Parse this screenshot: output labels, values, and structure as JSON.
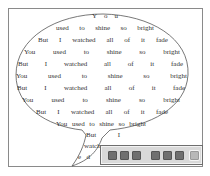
{
  "canvas": {
    "background": "#ffffff",
    "frame_color": "#8a8a8a"
  },
  "bubble": {
    "stroke_color": "#555555",
    "lines": [
      {
        "words": [
          "Y",
          "o",
          "u"
        ],
        "left": 92,
        "top": 12,
        "width": 26
      },
      {
        "words": [
          "used",
          "to",
          "shine",
          "so",
          "bright"
        ],
        "left": 56,
        "top": 24,
        "width": 98
      },
      {
        "words": [
          "But",
          "I",
          "watched",
          "all",
          "of",
          "it",
          "fade"
        ],
        "left": 38,
        "top": 36,
        "width": 130
      },
      {
        "words": [
          "You",
          "used",
          "to",
          "shine",
          "so",
          "bright"
        ],
        "left": 24,
        "top": 48,
        "width": 156
      },
      {
        "words": [
          "But",
          "I",
          "watched",
          "all",
          "of",
          "it",
          "fade"
        ],
        "left": 18,
        "top": 60,
        "width": 165
      },
      {
        "words": [
          "You",
          "used",
          "to",
          "shine",
          "so",
          "bright"
        ],
        "left": 16,
        "top": 72,
        "width": 171
      },
      {
        "words": [
          "But",
          "I",
          "watched",
          "all",
          "of",
          "it",
          "fade"
        ],
        "left": 17,
        "top": 84,
        "width": 168
      },
      {
        "words": [
          "You",
          "used",
          "to",
          "shine",
          "so",
          "bright"
        ],
        "left": 22,
        "top": 96,
        "width": 158
      },
      {
        "words": [
          "But",
          "I",
          "watched",
          "all",
          "of",
          "it",
          "fade"
        ],
        "left": 36,
        "top": 108,
        "width": 132
      },
      {
        "words": [
          "You",
          "used",
          "to",
          "shine",
          "so",
          "bright"
        ],
        "left": 56,
        "top": 120,
        "width": 90
      },
      {
        "words": [
          "But",
          "I"
        ],
        "left": 86,
        "top": 131,
        "width": 34
      },
      {
        "words": [
          "watch"
        ],
        "left": 84,
        "top": 142,
        "width": 22
      },
      {
        "words": [
          "e",
          "d"
        ],
        "left": 78,
        "top": 153,
        "width": 12
      }
    ]
  },
  "toolbar": {
    "background": "#d9d9d9",
    "buttons": [
      {
        "name": "tool-1",
        "icon": "square-icon",
        "x": 7,
        "style": "dark"
      },
      {
        "name": "tool-2",
        "icon": "square-icon",
        "x": 19,
        "style": "dark"
      },
      {
        "name": "tool-3",
        "icon": "square-icon",
        "x": 31,
        "style": "dark"
      },
      {
        "name": "tool-4",
        "icon": "square-icon",
        "x": 50,
        "style": "dark"
      },
      {
        "name": "tool-5",
        "icon": "square-icon",
        "x": 62,
        "style": "dark"
      },
      {
        "name": "tool-6",
        "icon": "square-icon",
        "x": 74,
        "style": "dark"
      },
      {
        "name": "tool-7",
        "icon": "square-icon",
        "x": 89,
        "style": "light"
      }
    ]
  }
}
